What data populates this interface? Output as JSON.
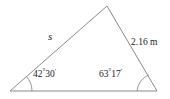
{
  "figure": {
    "type": "triangle-diagram",
    "background_color": "#ffffff",
    "stroke_color": "#8a8a8a",
    "text_color": "#1a1a1a",
    "vertices": {
      "left": {
        "x": 10,
        "y": 91
      },
      "apex": {
        "x": 107,
        "y": 6
      },
      "right": {
        "x": 157,
        "y": 91
      }
    },
    "sides": [
      {
        "name": "left-side",
        "label": "s",
        "from": "left",
        "to": "apex",
        "known": false
      },
      {
        "name": "right-side",
        "label": "2.16 m",
        "value": 2.16,
        "unit": "m",
        "from": "apex",
        "to": "right",
        "known": true
      },
      {
        "name": "base-side",
        "label": "",
        "from": "left",
        "to": "right",
        "known": false
      }
    ],
    "angles": [
      {
        "name": "left-angle",
        "degrees": 42,
        "minutes": 30,
        "degrees_text": "42",
        "degree_symbol": "°",
        "minutes_text": "30",
        "minute_symbol": "′",
        "full_label": "42°30′",
        "arc_radius": 22
      },
      {
        "name": "right-angle",
        "degrees": 63,
        "minutes": 17,
        "degrees_text": "63",
        "degree_symbol": "°",
        "minutes_text": "17",
        "minute_symbol": "′",
        "full_label": "63°17′",
        "arc_radius": 20
      }
    ],
    "labels": {
      "side_s": "s",
      "side_known": "2.16 m"
    }
  }
}
